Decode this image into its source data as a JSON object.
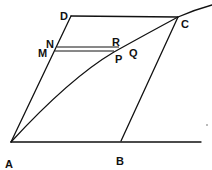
{
  "diagram": {
    "type": "geometric-construction",
    "points": {
      "A": {
        "label": "A",
        "x": 11,
        "y": 142
      },
      "B": {
        "label": "B",
        "x": 121,
        "y": 141
      },
      "C": {
        "label": "C",
        "x": 178,
        "y": 17
      },
      "D": {
        "label": "D",
        "x": 71,
        "y": 16
      },
      "N": {
        "label": "N",
        "x": 57,
        "y": 47
      },
      "M": {
        "label": "M",
        "x": 55,
        "y": 52
      },
      "R": {
        "label": "R",
        "x": 118,
        "y": 47
      },
      "P": {
        "label": "P",
        "x": 114,
        "y": 52
      },
      "Q": {
        "label": "Q"
      }
    },
    "segments": [
      "AB",
      "AD",
      "DC",
      "BC",
      "NR",
      "MP"
    ],
    "curves": [
      "A-P-Q-C arc"
    ],
    "stroke_color": "#111111",
    "background": "#ffffff"
  }
}
